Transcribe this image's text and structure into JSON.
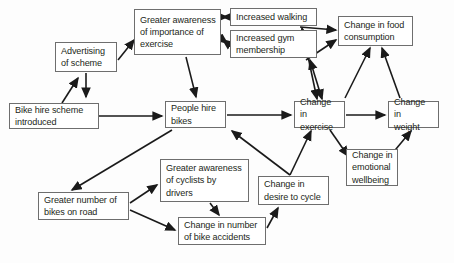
{
  "diagram": {
    "type": "causal-loop-flowchart",
    "title_visible": false,
    "background_color": "#fdfdfd",
    "box_border_color": "#6e6e6e",
    "box_fill_color": "#ffffff",
    "text_color": "#231f20",
    "arrow_color": "#1a1a1a",
    "nodes": [
      {
        "id": "bike_hire_scheme",
        "label": "Bike hire scheme\nintroduced",
        "x": 9,
        "y": 103,
        "w": 90,
        "h": 26
      },
      {
        "id": "advertising",
        "label": "Advertising\nof scheme",
        "x": 55,
        "y": 42,
        "w": 62,
        "h": 30
      },
      {
        "id": "greater_awareness_exercise",
        "label": "Greater awareness\nof importance of\nexercise",
        "x": 134,
        "y": 9,
        "w": 87,
        "h": 46
      },
      {
        "id": "increased_walking",
        "label": "Increased walking",
        "x": 230,
        "y": 8,
        "w": 87,
        "h": 18
      },
      {
        "id": "increased_gym",
        "label": "Increased gym\nmembership",
        "x": 230,
        "y": 30,
        "w": 87,
        "h": 28
      },
      {
        "id": "change_food",
        "label": "Change in food\nconsumption",
        "x": 338,
        "y": 16,
        "w": 75,
        "h": 30
      },
      {
        "id": "people_hire_bikes",
        "label": "People hire\nbikes",
        "x": 165,
        "y": 101,
        "w": 61,
        "h": 27
      },
      {
        "id": "change_exercise",
        "label": "Change in\nexercise",
        "x": 294,
        "y": 101,
        "w": 51,
        "h": 27
      },
      {
        "id": "change_weight",
        "label": "Change in\nweight",
        "x": 388,
        "y": 101,
        "w": 51,
        "h": 27
      },
      {
        "id": "change_emotional",
        "label": "Change in\nemotional\nwellbeing",
        "x": 346,
        "y": 149,
        "w": 52,
        "h": 37
      },
      {
        "id": "change_desire_cycle",
        "label": "Change in\ndesire to cycle",
        "x": 258,
        "y": 176,
        "w": 71,
        "h": 29
      },
      {
        "id": "greater_awareness_cyclists",
        "label": "Greater awareness\nof cyclists by\ndrivers",
        "x": 160,
        "y": 159,
        "w": 89,
        "h": 43
      },
      {
        "id": "greater_number_bikes",
        "label": "Greater number of\nbikes on road",
        "x": 38,
        "y": 192,
        "w": 91,
        "h": 28
      },
      {
        "id": "change_bike_accidents",
        "label": "Change in number\nof bike accidents",
        "x": 178,
        "y": 217,
        "w": 88,
        "h": 28
      }
    ],
    "edges": [
      {
        "id": "e1",
        "from": "bike_hire_scheme",
        "to": "advertising",
        "bidirectional": false,
        "points": "62,103 78,78"
      },
      {
        "id": "e2",
        "from": "advertising",
        "to": "greater_awareness_exercise",
        "bidirectional": false,
        "points": "118,60 134,40"
      },
      {
        "id": "e3",
        "from": "advertising",
        "to": "people_hire_bikes",
        "bidirectional": false,
        "points": "86,73 86,97"
      },
      {
        "id": "e4",
        "from": "bike_hire_scheme",
        "to": "people_hire_bikes",
        "bidirectional": false,
        "points": "99,116 162,116"
      },
      {
        "id": "e5",
        "from": "greater_awareness_exercise",
        "to": "increased_walking",
        "bidirectional": true,
        "points": "227,17 223,17"
      },
      {
        "id": "e6",
        "from": "greater_awareness_exercise",
        "to": "increased_gym",
        "bidirectional": true,
        "points": "223,40 227,43"
      },
      {
        "id": "e7",
        "from": "greater_awareness_exercise",
        "to": "people_hire_bikes",
        "bidirectional": false,
        "points": "186,57 196,97"
      },
      {
        "id": "e8",
        "from": "increased_walking",
        "to": "change_food",
        "bidirectional": false,
        "points": "300,27 336,30"
      },
      {
        "id": "e9",
        "from": "increased_gym",
        "to": "change_food",
        "bidirectional": false,
        "points": "306,60 336,40"
      },
      {
        "id": "e10",
        "from": "change_exercise",
        "to": "increased_walking",
        "bidirectional": true,
        "points": "317,99 302,28"
      },
      {
        "id": "e11",
        "from": "change_exercise",
        "to": "increased_gym",
        "bidirectional": true,
        "points": "322,99 310,60"
      },
      {
        "id": "e12",
        "from": "change_exercise",
        "to": "change_food",
        "bidirectional": false,
        "points": "345,98 370,48"
      },
      {
        "id": "e13",
        "from": "change_weight",
        "to": "change_food",
        "bidirectional": false,
        "points": "400,98 382,48"
      },
      {
        "id": "e14",
        "from": "people_hire_bikes",
        "to": "change_exercise",
        "bidirectional": false,
        "points": "227,115 291,115"
      },
      {
        "id": "e15",
        "from": "change_exercise",
        "to": "change_weight",
        "bidirectional": false,
        "points": "346,115 385,115"
      },
      {
        "id": "e16",
        "from": "people_hire_bikes",
        "to": "greater_number_bikes",
        "bidirectional": false,
        "points": "172,130 72,190"
      },
      {
        "id": "e17",
        "from": "greater_number_bikes",
        "to": "greater_awareness_cyclists",
        "bidirectional": false,
        "points": "130,203 157,185"
      },
      {
        "id": "e18",
        "from": "greater_number_bikes",
        "to": "change_bike_accidents",
        "bidirectional": false,
        "points": "130,210 175,230"
      },
      {
        "id": "e19",
        "from": "greater_awareness_cyclists",
        "to": "change_bike_accidents",
        "bidirectional": false,
        "points": "210,203 219,215"
      },
      {
        "id": "e20",
        "from": "change_bike_accidents",
        "to": "change_desire_cycle",
        "bidirectional": false,
        "points": "267,228 278,208"
      },
      {
        "id": "e21",
        "from": "change_desire_cycle",
        "to": "people_hire_bikes",
        "bidirectional": false,
        "points": "290,175 232,131"
      },
      {
        "id": "e22",
        "from": "change_desire_cycle",
        "to": "change_exercise",
        "bidirectional": false,
        "points": "290,175 311,131"
      },
      {
        "id": "e23",
        "from": "change_exercise",
        "to": "change_emotional",
        "bidirectional": false,
        "points": "330,130 348,156"
      },
      {
        "id": "e24",
        "from": "change_emotional",
        "to": "change_weight",
        "bidirectional": false,
        "points": "391,155 411,131"
      }
    ]
  }
}
